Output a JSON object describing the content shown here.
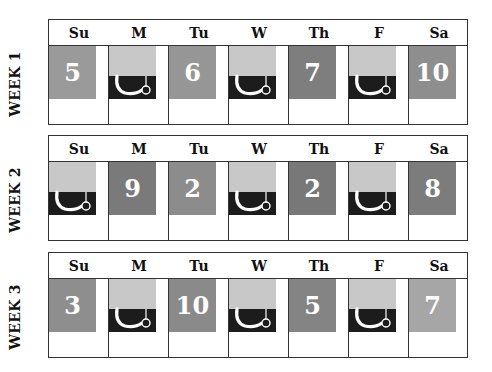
{
  "days": [
    "Su",
    "M",
    "Tu",
    "W",
    "Th",
    "F",
    "Sa"
  ],
  "colors": {
    "border": "#333333",
    "icon_light": "#c8c8c8",
    "icon_dark": "#1c1c1c",
    "number_text": "#ffffff"
  },
  "weeks": [
    {
      "label": "WEEK 1",
      "cells": [
        {
          "type": "number",
          "value": "5",
          "shade": "#9a9a9a"
        },
        {
          "type": "icon",
          "icon": "hook-icon"
        },
        {
          "type": "number",
          "value": "6",
          "shade": "#969696"
        },
        {
          "type": "icon",
          "icon": "hook-icon"
        },
        {
          "type": "number",
          "value": "7",
          "shade": "#7e7e7e"
        },
        {
          "type": "icon",
          "icon": "hook-icon"
        },
        {
          "type": "number",
          "value": "10",
          "shade": "#8e8e8e"
        }
      ]
    },
    {
      "label": "WEEK 2",
      "cells": [
        {
          "type": "icon",
          "icon": "hook-icon"
        },
        {
          "type": "number",
          "value": "9",
          "shade": "#7a7a7a"
        },
        {
          "type": "number",
          "value": "2",
          "shade": "#8c8c8c"
        },
        {
          "type": "icon",
          "icon": "hook-icon"
        },
        {
          "type": "number",
          "value": "2",
          "shade": "#787878"
        },
        {
          "type": "icon",
          "icon": "hook-icon"
        },
        {
          "type": "number",
          "value": "8",
          "shade": "#7c7c7c"
        }
      ]
    },
    {
      "label": "WEEK 3",
      "cells": [
        {
          "type": "number",
          "value": "3",
          "shade": "#8e8e8e"
        },
        {
          "type": "icon",
          "icon": "hook-icon"
        },
        {
          "type": "number",
          "value": "10",
          "shade": "#8a8a8a"
        },
        {
          "type": "icon",
          "icon": "hook-icon"
        },
        {
          "type": "number",
          "value": "5",
          "shade": "#848484"
        },
        {
          "type": "icon",
          "icon": "hook-icon"
        },
        {
          "type": "number",
          "value": "7",
          "shade": "#a6a6a6"
        }
      ]
    }
  ]
}
